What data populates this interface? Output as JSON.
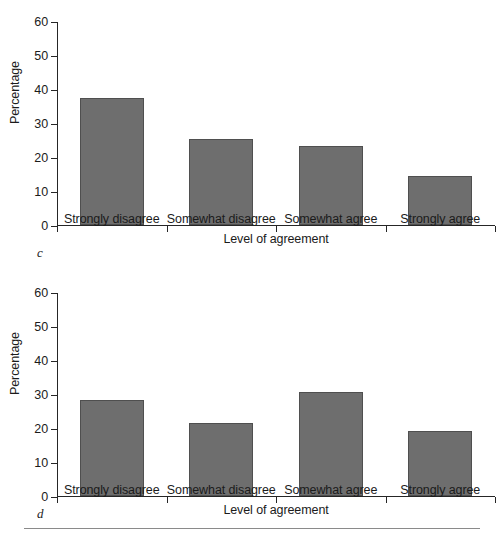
{
  "figure": {
    "background": "#ffffff",
    "bar_fill": "#6e6e6e",
    "bar_stroke": "#4f4f4f",
    "axis_color": "#262626",
    "rule_color": "#8a8a8a"
  },
  "chart_data": [
    {
      "type": "bar",
      "panel_label": "c",
      "title": "",
      "xlabel": "Level of agreement",
      "ylabel": "Percentage",
      "categories": [
        "Strongly disagree",
        "Somewhat disagree",
        "Somewhat agree",
        "Strongly agree"
      ],
      "values": [
        37.5,
        25.3,
        23.2,
        14.5
      ],
      "ylim": [
        0,
        60
      ],
      "yticks": [
        0,
        10,
        20,
        30,
        40,
        50,
        60
      ],
      "ytick_labels": [
        "0",
        "10",
        "20",
        "30",
        "40",
        "50",
        "60"
      ],
      "grid": false,
      "legend": "none"
    },
    {
      "type": "bar",
      "panel_label": "d",
      "title": "",
      "xlabel": "Level of agreement",
      "ylabel": "Percentage",
      "categories": [
        "Strongly disagree",
        "Somewhat disagree",
        "Somewhat agree",
        "Strongly agree"
      ],
      "values": [
        28.2,
        21.5,
        30.5,
        19.0
      ],
      "ylim": [
        0,
        60
      ],
      "yticks": [
        0,
        10,
        20,
        30,
        40,
        50,
        60
      ],
      "ytick_labels": [
        "0",
        "10",
        "20",
        "30",
        "40",
        "50",
        "60"
      ],
      "grid": false,
      "legend": "none"
    }
  ]
}
